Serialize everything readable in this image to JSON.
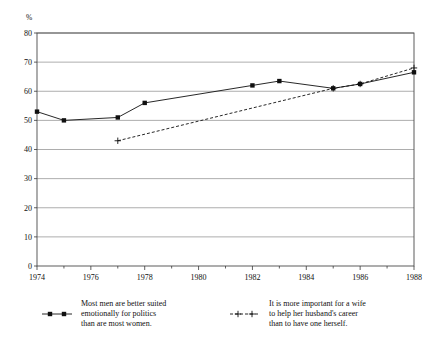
{
  "chart_data": {
    "type": "line",
    "title": "",
    "xlabel": "",
    "ylabel": "%",
    "xlim": [
      1974,
      1988
    ],
    "ylim": [
      0,
      80
    ],
    "grid": true,
    "legend_position": "bottom",
    "yticks": [
      0,
      10,
      20,
      30,
      40,
      50,
      60,
      70,
      80
    ],
    "ytick_labels": [
      "0",
      "10",
      "20",
      "30",
      "40",
      "50",
      "60",
      "70",
      "80"
    ],
    "xticks": [
      1974,
      1976,
      1978,
      1980,
      1982,
      1984,
      1986,
      1988
    ],
    "xtick_labels": [
      "1974",
      "1976",
      "1978",
      "1980",
      "1982",
      "1984",
      "1986",
      "1988"
    ],
    "xticks_minor": [
      1975,
      1977,
      1979,
      1981,
      1983,
      1985,
      1987
    ],
    "series": [
      {
        "name": "Most men are better suited emotionally for politics than are most women.",
        "marker": "square",
        "line_style": "solid",
        "color": "#101010",
        "x": [
          1974,
          1975,
          1977,
          1978,
          1982,
          1983,
          1985,
          1986,
          1988
        ],
        "values": [
          53,
          50,
          51,
          56,
          62,
          63.5,
          61,
          62.5,
          66.5
        ]
      },
      {
        "name": "It is more important for a wife to help her husband's career than to have one herself.",
        "marker": "plus",
        "line_style": "dashed",
        "color": "#101010",
        "x": [
          1977,
          1985,
          1986,
          1988
        ],
        "values": [
          43,
          61,
          62.5,
          68
        ]
      }
    ]
  },
  "legend": {
    "entries": [
      {
        "marker": "square",
        "line_style": "solid",
        "lines": [
          "Most men are better suited",
          "emotionally for politics",
          "than are most women."
        ]
      },
      {
        "marker": "plus",
        "line_style": "dashed",
        "lines": [
          "It is more important for a wife",
          "to help her husband's career",
          "than to have one herself."
        ]
      }
    ]
  }
}
